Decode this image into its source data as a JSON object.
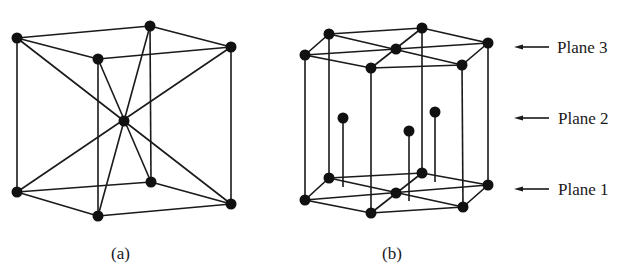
{
  "figure": {
    "panels": [
      {
        "id": "a",
        "caption": "(a)",
        "structure": "body-centered cubic unit cell"
      },
      {
        "id": "b",
        "caption": "(b)",
        "structure": "hexagonal close-packed unit cell"
      }
    ],
    "plane_labels": [
      {
        "label": "Plane 3"
      },
      {
        "label": "Plane 2"
      },
      {
        "label": "Plane 1"
      }
    ],
    "colors": {
      "line": "#1a1a1a",
      "atom": "#111111",
      "background": "#ffffff"
    }
  }
}
